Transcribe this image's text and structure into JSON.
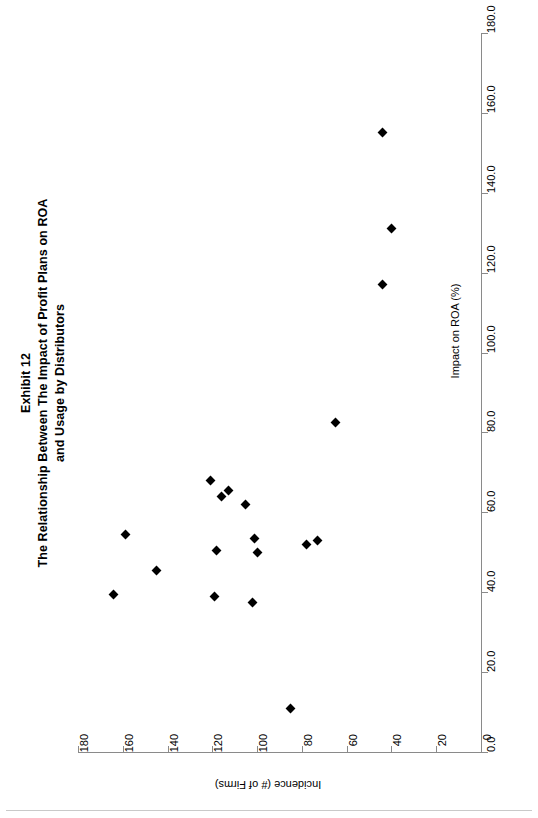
{
  "title": {
    "lines": [
      "Exhibit 12",
      "The Relationship Between The Impact of Profit Plans on ROA",
      "and Usage by Distributors"
    ]
  },
  "chart_data": {
    "type": "scatter",
    "orientation": "rotated-90-ccw",
    "xlabel": "Impact on ROA (%)",
    "ylabel": "Incidence (# of Firms)",
    "xlim": [
      0,
      180
    ],
    "ylim": [
      0,
      180
    ],
    "x_ticks": [
      "0.0",
      "20.0",
      "40.0",
      "60.0",
      "80.0",
      "100.0",
      "120.0",
      "140.0",
      "160.0",
      "180.0"
    ],
    "x_tick_values": [
      0,
      20,
      40,
      60,
      80,
      100,
      120,
      140,
      160,
      180
    ],
    "y_ticks": [
      "0",
      "20",
      "40",
      "60",
      "80",
      "100",
      "120",
      "140",
      "160",
      "180"
    ],
    "y_tick_values": [
      0,
      20,
      40,
      60,
      80,
      100,
      120,
      140,
      160,
      180
    ],
    "grid": false,
    "legend": false,
    "marker": "filled-diamond",
    "marker_color": "#000000",
    "axis_color": "#8a8a8a",
    "points": [
      {
        "impact": 68.0,
        "incidence": 121.0
      },
      {
        "impact": 64.0,
        "incidence": 116.0
      },
      {
        "impact": 65.5,
        "incidence": 113.0
      },
      {
        "impact": 62.0,
        "incidence": 105.0
      },
      {
        "impact": 54.5,
        "incidence": 159.0
      },
      {
        "impact": 53.5,
        "incidence": 101.0
      },
      {
        "impact": 52.0,
        "incidence": 78.0
      },
      {
        "impact": 53.0,
        "incidence": 73.0
      },
      {
        "impact": 50.5,
        "incidence": 118.0
      },
      {
        "impact": 50.0,
        "incidence": 100.0
      },
      {
        "impact": 45.5,
        "incidence": 145.0
      },
      {
        "impact": 39.5,
        "incidence": 164.0
      },
      {
        "impact": 39.0,
        "incidence": 119.0
      },
      {
        "impact": 37.5,
        "incidence": 102.0
      },
      {
        "impact": 82.5,
        "incidence": 65.0
      },
      {
        "impact": 117.0,
        "incidence": 44.0
      },
      {
        "impact": 131.0,
        "incidence": 40.0
      },
      {
        "impact": 155.0,
        "incidence": 44.0
      },
      {
        "impact": 11.0,
        "incidence": 85.0
      }
    ]
  }
}
